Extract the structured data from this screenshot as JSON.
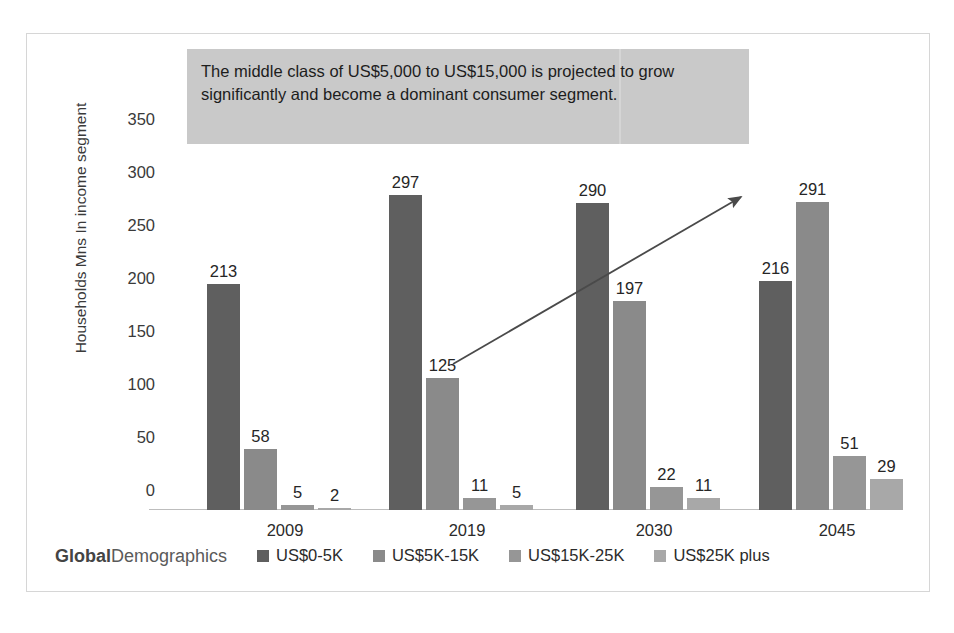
{
  "annotation": {
    "text": "The  middle class of US$5,000 to US$15,000 is projected to grow significantly and become a dominant consumer segment."
  },
  "branding": {
    "strong": "Global",
    "rest": "Demographics"
  },
  "chart_data": {
    "type": "bar",
    "title": "",
    "xlabel": "",
    "ylabel": "Households Mns In income segment",
    "categories": [
      "2009",
      "2019",
      "2030",
      "2045"
    ],
    "ylim": [
      0,
      350
    ],
    "yticks": [
      "0",
      "50",
      "100",
      "150",
      "200",
      "250",
      "300",
      "350"
    ],
    "grid": false,
    "legend_position": "bottom",
    "series": [
      {
        "name": "US$0-5K",
        "color": "#5f5f5f",
        "values": [
          213,
          297,
          290,
          216
        ]
      },
      {
        "name": "US$5K-15K",
        "color": "#8a8a8a",
        "values": [
          58,
          125,
          197,
          291
        ]
      },
      {
        "name": "US$15K-25K",
        "color": "#969696",
        "values": [
          5,
          11,
          22,
          51
        ]
      },
      {
        "name": "US$25K plus",
        "color": "#a8a8a8",
        "values": [
          2,
          5,
          11,
          29
        ]
      }
    ],
    "annotations": [
      {
        "type": "arrow",
        "label": "growth-trend-arrow",
        "from": [
          125,
          "2019"
        ],
        "to": [
          305,
          "2030"
        ]
      }
    ]
  }
}
